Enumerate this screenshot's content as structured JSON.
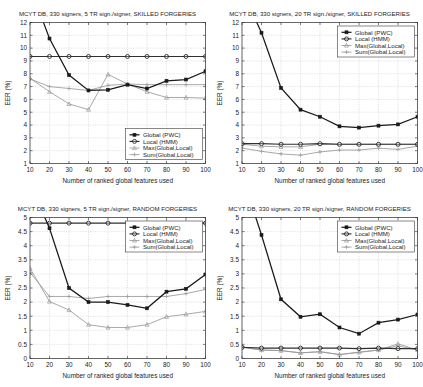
{
  "figure": {
    "panel_count": 4,
    "width": 423,
    "height": 387
  },
  "common": {
    "xlabel": "Number of ranked global features used",
    "ylabel": "EER (%)",
    "x_values": [
      10,
      20,
      30,
      40,
      50,
      60,
      70,
      80,
      90,
      100
    ],
    "x_ticklabels": [
      "10",
      "20",
      "30",
      "40",
      "50",
      "60",
      "70",
      "80",
      "90",
      "100"
    ],
    "legend_labels": [
      "Global (PWC)",
      "Local (HMM)",
      "Max(Global,Local)",
      "Sum(Global,Local)"
    ],
    "colors": {
      "global": "#1a1a1a",
      "local": "#303030",
      "max": "#9a9a9a",
      "sum": "#9a9a9a",
      "axis": "#2b2b2b",
      "grid": "#b9b9b9",
      "background": "#ffffff"
    }
  },
  "chart_data": [
    {
      "id": "top-left",
      "type": "line",
      "title": "MCYT DB, 330 signers, 5 TR sign./signer, SKILLED FORGERIES",
      "xlabel": "Number of ranked global features used",
      "ylabel": "EER (%)",
      "x": [
        10,
        20,
        30,
        40,
        50,
        60,
        70,
        80,
        90,
        100
      ],
      "xlim": [
        10,
        100
      ],
      "ylim": [
        1,
        12
      ],
      "yticks": [
        1,
        2,
        3,
        4,
        5,
        6,
        7,
        8,
        9,
        10,
        11,
        12
      ],
      "yticklabels": [
        "1",
        "2",
        "3",
        "4",
        "5",
        "6",
        "7",
        "8",
        "9",
        "10",
        "11",
        "12"
      ],
      "grid": true,
      "legend_position": "lower right",
      "series": [
        {
          "name": "Global (PWC)",
          "values": [
            14.8,
            10.75,
            7.9,
            6.7,
            6.75,
            7.15,
            6.85,
            7.45,
            7.55,
            8.2
          ]
        },
        {
          "name": "Local (HMM)",
          "values": [
            9.35,
            9.35,
            9.35,
            9.35,
            9.35,
            9.35,
            9.35,
            9.35,
            9.35,
            9.35
          ]
        },
        {
          "name": "Max(Global,Local)",
          "values": [
            7.65,
            6.6,
            5.65,
            5.2,
            7.95,
            7.2,
            6.6,
            6.15,
            6.15,
            6.1
          ]
        },
        {
          "name": "Sum(Global,Local)",
          "values": [
            7.6,
            7.0,
            6.85,
            6.7,
            7.1,
            7.2,
            7.15,
            7.15,
            7.15,
            7.15
          ]
        }
      ]
    },
    {
      "id": "top-right",
      "type": "line",
      "title": "MCYT DB, 330 signers, 20 TR sign./signer, SKILLED FORGERIES",
      "xlabel": "Number of ranked global features used",
      "ylabel": "EER (%)",
      "x": [
        10,
        20,
        30,
        40,
        50,
        60,
        70,
        80,
        90,
        100
      ],
      "xlim": [
        10,
        100
      ],
      "ylim": [
        1,
        12
      ],
      "yticks": [
        1,
        2,
        3,
        4,
        5,
        6,
        7,
        8,
        9,
        10,
        11,
        12
      ],
      "yticklabels": [
        "1",
        "2",
        "3",
        "4",
        "5",
        "6",
        "7",
        "8",
        "9",
        "10",
        "11",
        "12"
      ],
      "grid": true,
      "legend_position": "upper right",
      "series": [
        {
          "name": "Global (PWC)",
          "values": [
            14.5,
            11.2,
            6.9,
            5.2,
            4.65,
            3.9,
            3.8,
            3.95,
            4.05,
            4.65
          ]
        },
        {
          "name": "Local (HMM)",
          "values": [
            2.55,
            2.55,
            2.5,
            2.5,
            2.55,
            2.5,
            2.5,
            2.5,
            2.5,
            2.5
          ]
        },
        {
          "name": "Max(Global,Local)",
          "values": [
            2.5,
            2.35,
            2.3,
            2.3,
            2.5,
            2.5,
            2.5,
            2.5,
            2.5,
            2.5
          ]
        },
        {
          "name": "Sum(Global,Local)",
          "values": [
            2.2,
            1.95,
            1.75,
            1.65,
            1.9,
            2.05,
            2.05,
            2.2,
            2.1,
            2.35
          ]
        }
      ]
    },
    {
      "id": "bottom-left",
      "type": "line",
      "title": "MCYT DB, 330 signers, 5 TR sign./signer, RANDOM FORGERIES",
      "xlabel": "Number of ranked global features used",
      "ylabel": "EER (%)",
      "x": [
        10,
        20,
        30,
        40,
        50,
        60,
        70,
        80,
        90,
        100
      ],
      "xlim": [
        10,
        100
      ],
      "ylim": [
        0,
        5
      ],
      "yticks": [
        0,
        0.5,
        1,
        1.5,
        2,
        2.5,
        3,
        3.5,
        4,
        4.5,
        5
      ],
      "yticklabels": [
        "0",
        "0.5",
        "1",
        "1.5",
        "2",
        "2.5",
        "3",
        "3.5",
        "4",
        "4.5",
        "5"
      ],
      "grid": true,
      "legend_position": "upper right",
      "series": [
        {
          "name": "Global (PWC)",
          "values": [
            6.2,
            4.62,
            2.5,
            2.0,
            2.0,
            1.9,
            1.78,
            2.37,
            2.47,
            2.98
          ]
        },
        {
          "name": "Local (HMM)",
          "values": [
            4.8,
            4.8,
            4.8,
            4.8,
            4.8,
            4.8,
            4.8,
            4.8,
            4.8,
            4.8
          ]
        },
        {
          "name": "Max(Global,Local)",
          "values": [
            3.2,
            2.02,
            1.72,
            1.2,
            1.1,
            1.1,
            1.2,
            1.48,
            1.57,
            1.67
          ]
        },
        {
          "name": "Sum(Global,Local)",
          "values": [
            3.05,
            2.2,
            2.2,
            2.13,
            2.2,
            2.2,
            2.2,
            2.2,
            2.3,
            2.45
          ]
        }
      ]
    },
    {
      "id": "bottom-right",
      "type": "line",
      "title": "MCYT DB, 330 signers, 20 TR sign./signer, RANDOM FORGERIES",
      "xlabel": "Number of ranked global features used",
      "ylabel": "EER (%)",
      "x": [
        10,
        20,
        30,
        40,
        50,
        60,
        70,
        80,
        90,
        100
      ],
      "xlim": [
        10,
        100
      ],
      "ylim": [
        0,
        5
      ],
      "yticks": [
        0,
        0.5,
        1,
        1.5,
        2,
        2.5,
        3,
        3.5,
        4,
        4.5,
        5
      ],
      "yticklabels": [
        "0",
        "0.5",
        "1",
        "1.5",
        "2",
        "2.5",
        "3",
        "3.5",
        "4",
        "4.5",
        "5"
      ],
      "grid": true,
      "legend_position": "upper right",
      "series": [
        {
          "name": "Global (PWC)",
          "values": [
            6.5,
            4.38,
            2.1,
            1.48,
            1.57,
            1.1,
            0.88,
            1.27,
            1.38,
            1.56
          ]
        },
        {
          "name": "Local (HMM)",
          "values": [
            0.4,
            0.37,
            0.37,
            0.37,
            0.37,
            0.37,
            0.35,
            0.37,
            0.35,
            0.35
          ]
        },
        {
          "name": "Max(Global,Local)",
          "values": [
            0.4,
            0.3,
            0.28,
            0.2,
            0.24,
            0.14,
            0.22,
            0.3,
            0.52,
            0.3
          ]
        },
        {
          "name": "Sum(Global,Local)",
          "values": [
            0.4,
            0.3,
            0.28,
            0.2,
            0.24,
            0.14,
            0.22,
            0.3,
            0.45,
            0.3
          ]
        }
      ]
    }
  ]
}
